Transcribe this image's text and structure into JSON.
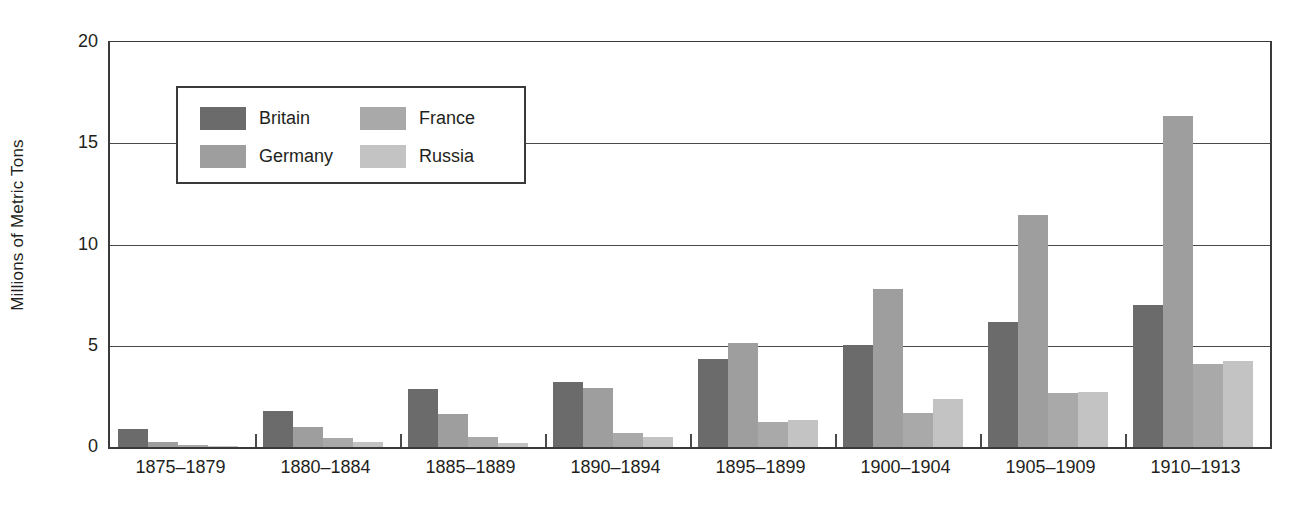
{
  "chart_data": {
    "type": "bar",
    "title": "",
    "subtitle": "",
    "xlabel": "",
    "ylabel": "Millions of Metric Tons",
    "ylim": [
      0,
      20
    ],
    "yticks": [
      0,
      5,
      10,
      15,
      20
    ],
    "ytick_labels": [
      "0",
      "5",
      "10",
      "15",
      "20"
    ],
    "grid": true,
    "legend_position": "upper-left-inside",
    "grouping": "grouped",
    "categories": [
      "1875–1879",
      "1880–1884",
      "1885–1889",
      "1890–1894",
      "1895–1899",
      "1900–1904",
      "1905–1909",
      "1910–1913"
    ],
    "series": [
      {
        "name": "Britain",
        "color": "#6b6b6b",
        "values": [
          0.9,
          1.8,
          2.85,
          3.2,
          4.35,
          5.05,
          6.15,
          7.0
        ]
      },
      {
        "name": "Germany",
        "color": "#9e9e9e",
        "values": [
          0.25,
          1.0,
          1.65,
          2.9,
          5.15,
          7.8,
          11.45,
          16.35
        ]
      },
      {
        "name": "France",
        "color": "#a9a9a9",
        "values": [
          0.1,
          0.45,
          0.5,
          0.7,
          1.25,
          1.7,
          2.65,
          4.1
        ]
      },
      {
        "name": "Russia",
        "color": "#c3c3c3",
        "values": [
          0.05,
          0.25,
          0.2,
          0.5,
          1.35,
          2.35,
          2.7,
          4.25
        ]
      }
    ]
  },
  "legend": {
    "items": [
      {
        "label": "Britain",
        "color": "#6b6b6b"
      },
      {
        "label": "France",
        "color": "#a9a9a9"
      },
      {
        "label": "Germany",
        "color": "#9e9e9e"
      },
      {
        "label": "Russia",
        "color": "#c3c3c3"
      }
    ]
  },
  "axis": {
    "line_color": "#3a3a3a",
    "grid_color": "#4a4a4a",
    "text_color": "#231f20"
  }
}
